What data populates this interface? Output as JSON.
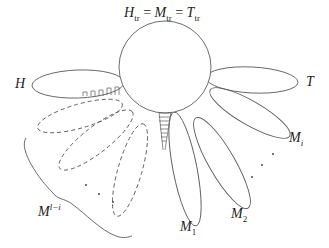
{
  "title": {
    "h": "H",
    "h_sub": "tr",
    "eq1": " = ",
    "m": "M",
    "m_sub": "tr",
    "eq2": " = ",
    "t": "T",
    "t_sub": "tr"
  },
  "labels": {
    "H": "H",
    "T": "T",
    "Mi": "M",
    "Mi_sub": "i",
    "M2": "M",
    "M2_sub": "2",
    "M1": "M",
    "M1_sub": "1",
    "Mli": "M",
    "Mli_sup": "l−i"
  },
  "colors": {
    "stroke": "#555555",
    "text": "#222222",
    "background": "#ffffff"
  }
}
